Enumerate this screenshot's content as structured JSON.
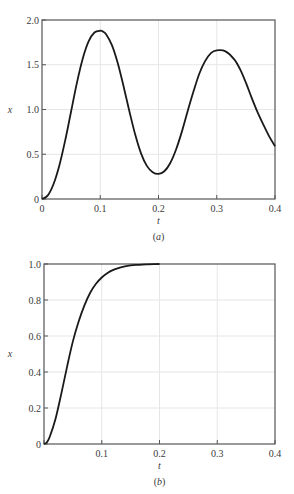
{
  "chart_data": [
    {
      "type": "line",
      "panel_label": "a",
      "caption": "(a)",
      "title": "",
      "xlabel": "t",
      "ylabel": "x",
      "xlim": [
        0,
        0.4
      ],
      "ylim": [
        0,
        2.0
      ],
      "xticks": [
        0,
        0.1,
        0.2,
        0.3,
        0.4
      ],
      "xtick_labels": [
        "0",
        "0.1",
        "0.2",
        "0.3",
        "0.4"
      ],
      "yticks": [
        0,
        0.5,
        1.0,
        1.5,
        2.0
      ],
      "ytick_labels": [
        "0",
        "0.5",
        "1.0",
        "1.5",
        "2.0"
      ],
      "grid": true,
      "legend": null,
      "series": [
        {
          "name": "x(t)",
          "x": [
            0,
            0.01,
            0.02,
            0.03,
            0.04,
            0.05,
            0.06,
            0.07,
            0.08,
            0.09,
            0.1,
            0.105,
            0.11,
            0.12,
            0.13,
            0.14,
            0.15,
            0.16,
            0.17,
            0.18,
            0.19,
            0.2,
            0.21,
            0.22,
            0.23,
            0.24,
            0.25,
            0.26,
            0.27,
            0.28,
            0.29,
            0.3,
            0.315,
            0.33,
            0.34,
            0.35,
            0.36,
            0.37,
            0.38,
            0.39,
            0.4
          ],
          "values": [
            0,
            0.04,
            0.17,
            0.38,
            0.66,
            0.98,
            1.3,
            1.57,
            1.76,
            1.86,
            1.88,
            1.87,
            1.84,
            1.72,
            1.52,
            1.26,
            0.98,
            0.72,
            0.51,
            0.37,
            0.3,
            0.28,
            0.31,
            0.4,
            0.55,
            0.75,
            0.98,
            1.2,
            1.4,
            1.54,
            1.63,
            1.66,
            1.65,
            1.56,
            1.45,
            1.3,
            1.13,
            0.97,
            0.83,
            0.7,
            0.59
          ]
        }
      ]
    },
    {
      "type": "line",
      "panel_label": "b",
      "caption": "(b)",
      "title": "",
      "xlabel": "t",
      "ylabel": "x",
      "xlim": [
        0,
        0.4
      ],
      "ylim": [
        0,
        1.0
      ],
      "xticks": [
        0,
        0.1,
        0.2,
        0.3,
        0.4
      ],
      "xtick_labels": [
        "",
        "0.1",
        "0.2",
        "0.3",
        "0.4"
      ],
      "yticks": [
        0,
        0.2,
        0.4,
        0.6,
        0.8,
        1.0
      ],
      "ytick_labels": [
        "0",
        "0.2",
        "0.4",
        "0.6",
        "0.8",
        "1.0"
      ],
      "grid": true,
      "legend": null,
      "series": [
        {
          "name": "x(t)",
          "x": [
            0,
            0.005,
            0.01,
            0.02,
            0.03,
            0.04,
            0.05,
            0.06,
            0.07,
            0.08,
            0.09,
            0.1,
            0.11,
            0.12,
            0.13,
            0.14,
            0.15,
            0.16,
            0.17,
            0.18,
            0.19,
            0.2
          ],
          "values": [
            0,
            0.01,
            0.04,
            0.14,
            0.28,
            0.43,
            0.57,
            0.68,
            0.77,
            0.84,
            0.89,
            0.925,
            0.95,
            0.967,
            0.979,
            0.987,
            0.992,
            0.995,
            0.997,
            0.998,
            0.999,
            1.0
          ]
        }
      ]
    }
  ]
}
